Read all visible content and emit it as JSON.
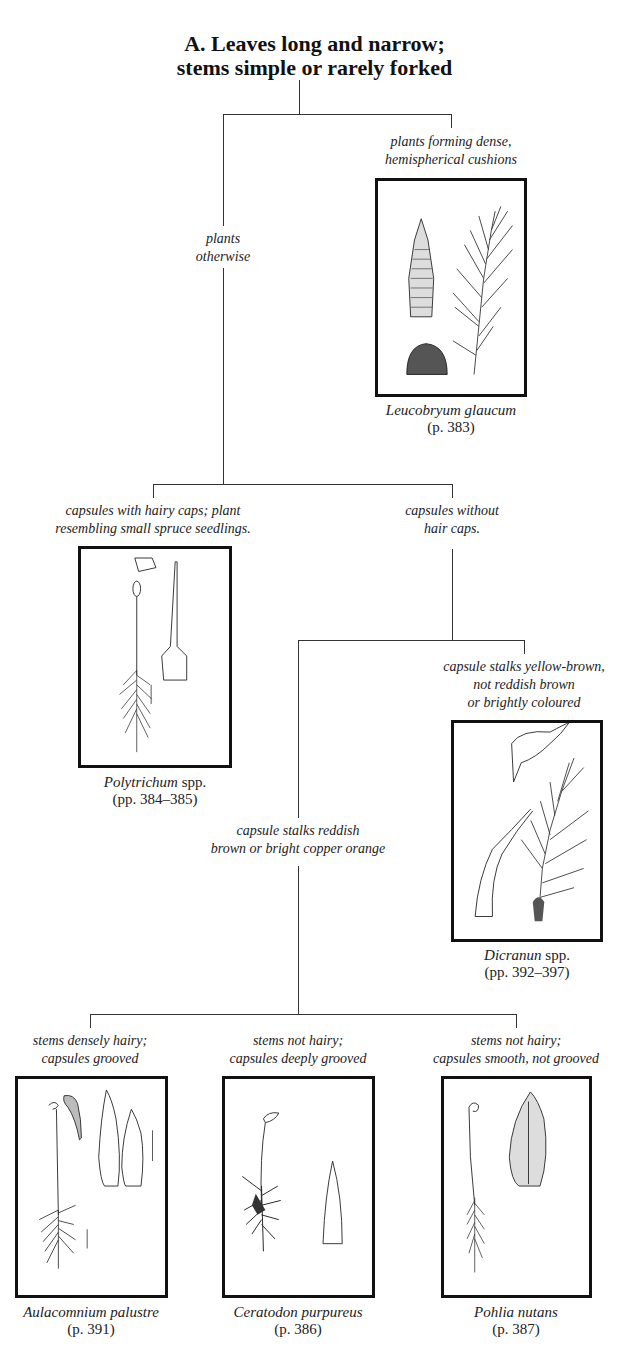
{
  "title": {
    "line1": "A. Leaves long and narrow;",
    "line2": "stems simple or rarely forked"
  },
  "branches": {
    "cushions": {
      "line1": "plants forming dense,",
      "line2": "hemispherical cushions"
    },
    "otherwise": {
      "line1": "plants",
      "line2": "otherwise"
    },
    "hairy_caps": {
      "line1": "capsules with hairy caps; plant",
      "line2": "resembling small spruce seedlings."
    },
    "without_hair_caps": {
      "line1": "capsules without",
      "line2": "hair caps."
    },
    "yellow_brown": {
      "line1": "capsule stalks yellow-brown,",
      "line2": "not reddish brown",
      "line3": "or brightly coloured"
    },
    "reddish": {
      "line1": "capsule stalks reddish",
      "line2": "brown or bright copper orange"
    },
    "densely_hairy": {
      "line1": "stems densely hairy;",
      "line2": "capsules grooved"
    },
    "deeply_grooved": {
      "line1": "stems not hairy;",
      "line2": "capsules deeply grooved"
    },
    "smooth": {
      "line1": "stems not hairy;",
      "line2": "capsules smooth, not grooved"
    }
  },
  "species": {
    "leucobryum": {
      "name": "Leucobryum glaucum",
      "suffix": "",
      "pages": "(p. 383)",
      "icon": "leucobryum-illustration-icon"
    },
    "polytrichum": {
      "name": "Polytrichum",
      "suffix": " spp.",
      "pages": "(pp. 384–385)",
      "icon": "polytrichum-illustration-icon"
    },
    "dicranum": {
      "name": "Dicranun",
      "suffix": " spp.",
      "pages": "(pp. 392–397)",
      "icon": "dicranum-illustration-icon"
    },
    "aulacomnium": {
      "name": "Aulacomnium palustre",
      "suffix": "",
      "pages": "(p. 391)",
      "icon": "aulacomnium-illustration-icon"
    },
    "ceratodon": {
      "name": "Ceratodon purpureus",
      "suffix": "",
      "pages": "(p. 386)",
      "icon": "ceratodon-illustration-icon"
    },
    "pohlia": {
      "name": "Pohlia nutans",
      "suffix": "",
      "pages": "(p. 387)",
      "icon": "pohlia-illustration-icon"
    }
  },
  "colors": {
    "line": "#333333",
    "frame": "#111111",
    "text": "#222222",
    "background": "#ffffff"
  }
}
